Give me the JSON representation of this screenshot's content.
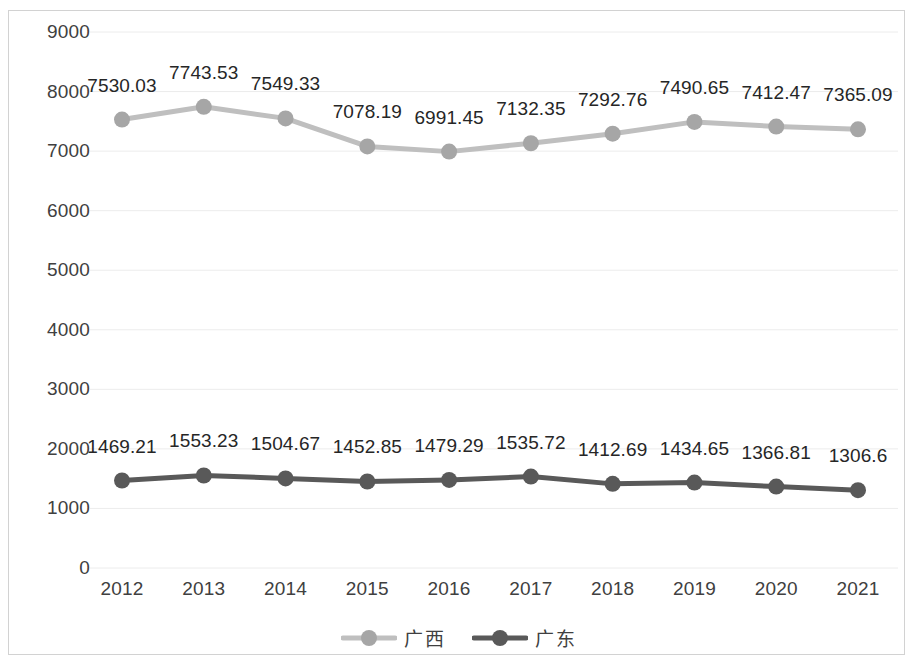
{
  "chart_data": {
    "type": "line",
    "title": "",
    "subtitle": "",
    "xlabel": "",
    "ylabel": "",
    "categories": [
      "2012",
      "2013",
      "2014",
      "2015",
      "2016",
      "2017",
      "2018",
      "2019",
      "2020",
      "2021"
    ],
    "ylim": [
      0,
      9000
    ],
    "yticks": [
      "0",
      "1000",
      "2000",
      "3000",
      "4000",
      "5000",
      "6000",
      "7000",
      "8000",
      "9000"
    ],
    "ytick_values": [
      0,
      1000,
      2000,
      3000,
      4000,
      5000,
      6000,
      7000,
      8000,
      9000
    ],
    "grid": true,
    "grid_axis": "y",
    "legend_position": "bottom",
    "series": [
      {
        "name": "广西",
        "color": "#bfbfbf",
        "marker": "circle",
        "values": [
          7530.03,
          7743.53,
          7549.33,
          7078.19,
          6991.45,
          7132.35,
          7292.76,
          7490.65,
          7412.47,
          7365.09
        ],
        "labels": [
          "7530.03",
          "7743.53",
          "7549.33",
          "7078.19",
          "6991.45",
          "7132.35",
          "7292.76",
          "7490.65",
          "7412.47",
          "7365.09"
        ]
      },
      {
        "name": "广东",
        "color": "#595959",
        "marker": "circle",
        "values": [
          1469.21,
          1553.23,
          1504.67,
          1452.85,
          1479.29,
          1535.72,
          1412.69,
          1434.65,
          1366.81,
          1306.6
        ],
        "labels": [
          "1469.21",
          "1553.23",
          "1504.67",
          "1452.85",
          "1479.29",
          "1535.72",
          "1412.69",
          "1434.65",
          "1366.81",
          "1306.6"
        ]
      }
    ]
  },
  "legend": {
    "items": [
      {
        "label": "广西",
        "color": "#bfbfbf"
      },
      {
        "label": "广东",
        "color": "#595959"
      }
    ]
  },
  "colors": {
    "plot_border": "#d2d2d2",
    "gridline": "#ececec",
    "text": "#404040",
    "label_text": "#262626",
    "background": "#ffffff"
  }
}
